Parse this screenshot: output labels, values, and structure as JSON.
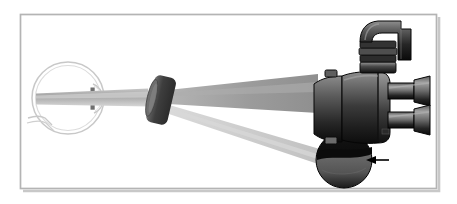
{
  "figure": {
    "canvas": {
      "width": 457,
      "height": 204,
      "background": "#ffffff"
    },
    "frame": {
      "name": "figure-border",
      "x": 20,
      "y": 14,
      "width": 417,
      "height": 175,
      "stroke": "#b9b9b9",
      "stroke_width": 1.6,
      "shadow_stroke": "#8e8e8e"
    },
    "palette": {
      "eye_outline": "#c9c9c9",
      "eye_outline_light": "#dcdcdc",
      "beam_dark": "#9a9a9a",
      "beam_light": "#cfcfcf",
      "beam_mid": "#ababab",
      "lens_body": "#4a4a4a",
      "lens_edge": "#8a8a8a",
      "body_dark": "#1c1c1c",
      "body_mid": "#6f6f6f",
      "body_light": "#9c9c9c",
      "tube_dark": "#141414",
      "tube_light": "#9a9a9a",
      "disk_dark": "#121212",
      "disk_face": "#4e4e4e",
      "arrow": "#000000"
    },
    "parts": [
      {
        "id": "eye",
        "name": "eye-globe",
        "label": "Eye globe"
      },
      {
        "id": "cornea",
        "name": "cornea-arc",
        "label": "Cornea"
      },
      {
        "id": "iris",
        "name": "iris-marks",
        "label": "Iris"
      },
      {
        "id": "optic-nerve",
        "name": "optic-nerve",
        "label": "Optic nerve"
      },
      {
        "id": "condensing-lens",
        "name": "condensing-lens",
        "label": "Condensing lens"
      },
      {
        "id": "observation-beam",
        "name": "observation-beam",
        "label": "Observation beam"
      },
      {
        "id": "illumination-beam",
        "name": "illumination-beam",
        "label": "Illumination beam"
      },
      {
        "id": "microscope-body",
        "name": "microscope-body",
        "label": "Microscope body"
      },
      {
        "id": "prism-head",
        "name": "prism-head",
        "label": "Prism head"
      },
      {
        "id": "ribbed-collar",
        "name": "ribbed-collar",
        "label": "Ribbed collar"
      },
      {
        "id": "eyepiece-upper",
        "name": "eyepiece-tube-upper",
        "label": "Upper eyepiece"
      },
      {
        "id": "eyepiece-lower",
        "name": "eyepiece-tube-lower",
        "label": "Lower eyepiece"
      },
      {
        "id": "illuminator-disk",
        "name": "illuminator-disk",
        "label": "Illuminator disk"
      },
      {
        "id": "slit-band",
        "name": "slit-band",
        "label": "Slit band"
      },
      {
        "id": "pointer-arrow",
        "name": "pointer-arrow",
        "label": "Pointer arrow"
      },
      {
        "id": "top-tab",
        "name": "body-top-tab",
        "label": "Body tab"
      },
      {
        "id": "bottom-tab",
        "name": "body-bottom-tab",
        "label": "Body lower tab"
      }
    ]
  }
}
